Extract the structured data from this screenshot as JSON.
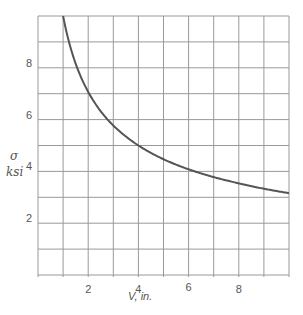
{
  "chart_data": {
    "type": "line",
    "title": "",
    "xlabel": "V, in.",
    "ylabel_symbol": "σ",
    "ylabel_unit": "ksi",
    "xlim": [
      0,
      10
    ],
    "ylim": [
      0,
      10
    ],
    "grid": true,
    "x_ticks": [
      2,
      4,
      6,
      8
    ],
    "y_ticks": [
      2,
      4,
      6,
      8
    ],
    "x_grid_step": 1,
    "y_grid_step": 1,
    "series": [
      {
        "name": "sigma vs V",
        "color": "#555555",
        "x": [
          1,
          1.5,
          2,
          2.5,
          3,
          3.5,
          4,
          5,
          6,
          7,
          8,
          9,
          10
        ],
        "y": [
          10,
          8.16,
          7.07,
          6.32,
          5.77,
          5.35,
          5.0,
          4.47,
          4.08,
          3.78,
          3.54,
          3.33,
          3.16
        ]
      }
    ],
    "legend": null
  }
}
